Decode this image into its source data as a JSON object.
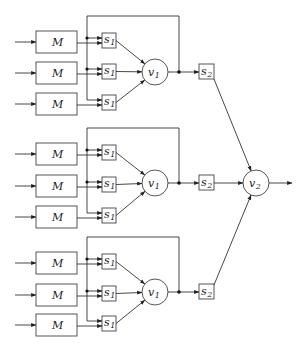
{
  "diagram": {
    "type": "block-diagram",
    "colors": {
      "stroke": "#333333",
      "background": "#ffffff"
    },
    "groups": [
      {
        "id": "group-1",
        "top_y": 16,
        "rows": [
          {
            "m_label": "M",
            "s_label": "s",
            "s_sub": "1",
            "y": 42
          },
          {
            "m_label": "M",
            "s_label": "s",
            "s_sub": "1",
            "y": 73
          },
          {
            "m_label": "M",
            "s_label": "s",
            "s_sub": "1",
            "y": 104
          }
        ],
        "v_label": "v",
        "v_sub": "1",
        "v_y": 72,
        "s2_label": "s",
        "s2_sub": "2"
      },
      {
        "id": "group-2",
        "top_y": 128,
        "rows": [
          {
            "m_label": "M",
            "s_label": "s",
            "s_sub": "1",
            "y": 154
          },
          {
            "m_label": "M",
            "s_label": "s",
            "s_sub": "1",
            "y": 186
          },
          {
            "m_label": "M",
            "s_label": "s",
            "s_sub": "1",
            "y": 217
          }
        ],
        "v_label": "v",
        "v_sub": "1",
        "v_y": 183,
        "s2_label": "s",
        "s2_sub": "2"
      },
      {
        "id": "group-3",
        "top_y": 237,
        "rows": [
          {
            "m_label": "M",
            "s_label": "s",
            "s_sub": "1",
            "y": 263
          },
          {
            "m_label": "M",
            "s_label": "s",
            "s_sub": "1",
            "y": 295
          },
          {
            "m_label": "M",
            "s_label": "s",
            "s_sub": "1",
            "y": 325
          }
        ],
        "v_label": "v",
        "v_sub": "1",
        "v_y": 292,
        "s2_label": "s",
        "s2_sub": "2"
      }
    ],
    "output_node": {
      "label": "v",
      "sub": "2"
    }
  }
}
